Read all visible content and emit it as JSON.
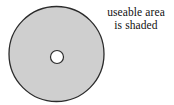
{
  "figure": {
    "name": "shaded-annulus-diagram",
    "background_color": "#ffffff"
  },
  "shapes": {
    "outer_disk": {
      "name": "outer-disk",
      "cx": 56.5,
      "cy": 54,
      "r": 47.5,
      "fill_color": "#cfcfcf",
      "stroke_color": "#2b2b2b",
      "stroke_width": 1.3
    },
    "center_hole": {
      "name": "center-hole",
      "cx": 57,
      "cy": 57,
      "r": 6.5,
      "fill_color": "#ffffff",
      "stroke_color": "#2b2b2b",
      "stroke_width": 1.2
    }
  },
  "caption": {
    "line1": "useable area",
    "line2": "is shaded",
    "text_color": "#111111",
    "align": "center"
  }
}
